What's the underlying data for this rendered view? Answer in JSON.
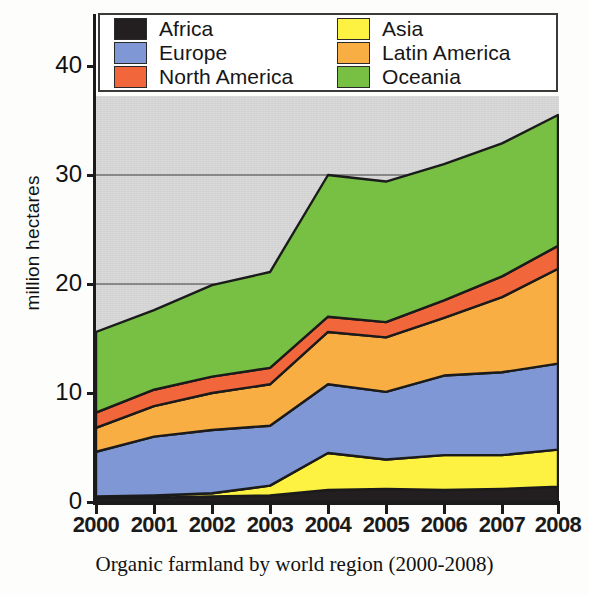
{
  "caption": "Organic farmland by world region (2000-2008)",
  "axes": {
    "ylabel": "million hectares",
    "yticks": [
      "0",
      "10",
      "20",
      "30",
      "40"
    ],
    "xticks": [
      "2000",
      "2001",
      "2002",
      "2003",
      "2004",
      "2005",
      "2006",
      "2007",
      "2008"
    ]
  },
  "legend": {
    "left": [
      {
        "label": "Africa",
        "color": "#231f20"
      },
      {
        "label": "Europe",
        "color": "#7f97d4"
      },
      {
        "label": "North America",
        "color": "#f2663c"
      }
    ],
    "right": [
      {
        "label": "Asia",
        "color": "#fdf141"
      },
      {
        "label": "Latin America",
        "color": "#f9ae43"
      },
      {
        "label": "Oceania",
        "color": "#77c council"
      }
    ]
  },
  "chart_data": {
    "type": "area",
    "stacked": true,
    "title": "Organic farmland by world region (2000-2008)",
    "xlabel": "",
    "ylabel": "million hectares",
    "x": [
      "2000",
      "2001",
      "2002",
      "2003",
      "2004",
      "2005",
      "2006",
      "2007",
      "2008"
    ],
    "ylim": [
      0,
      44
    ],
    "yticks": [
      0,
      10,
      20,
      30,
      40
    ],
    "gridlines": [
      20,
      30
    ],
    "grid": true,
    "legend_position": "top",
    "plot_background": "#d2d2d2",
    "series": [
      {
        "name": "Africa",
        "color": "#231f20",
        "values": [
          0.4,
          0.4,
          0.5,
          0.6,
          1.1,
          1.2,
          1.1,
          1.2,
          1.4
        ]
      },
      {
        "name": "Asia",
        "color": "#fdf141",
        "values": [
          0.1,
          0.2,
          0.3,
          0.9,
          3.4,
          2.7,
          3.2,
          3.1,
          3.4
        ]
      },
      {
        "name": "Europe",
        "color": "#7f97d4",
        "values": [
          4.1,
          5.4,
          5.8,
          5.5,
          6.3,
          6.2,
          7.3,
          7.6,
          7.9
        ]
      },
      {
        "name": "Latin America",
        "color": "#f9ae43",
        "values": [
          2.2,
          2.8,
          3.4,
          3.8,
          4.8,
          5.0,
          5.3,
          6.9,
          8.7
        ]
      },
      {
        "name": "North America",
        "color": "#f2663c",
        "values": [
          1.4,
          1.5,
          1.5,
          1.5,
          1.4,
          1.4,
          1.6,
          1.9,
          2.1
        ]
      },
      {
        "name": "Oceania",
        "color": "#77c043",
        "values": [
          7.4,
          7.3,
          8.4,
          8.8,
          13.0,
          12.9,
          12.5,
          12.2,
          12.0
        ]
      }
    ],
    "stacked_totals": [
      15.6,
      17.6,
      19.9,
      21.1,
      30.0,
      29.4,
      31.0,
      32.9,
      35.5
    ]
  }
}
